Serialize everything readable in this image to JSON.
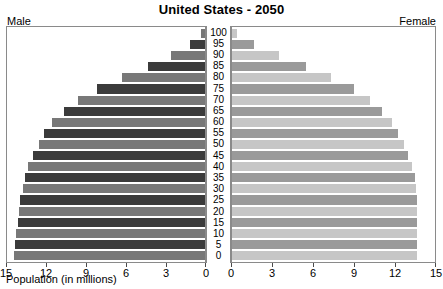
{
  "chart_data": {
    "type": "bar",
    "subtype": "population-pyramid",
    "title": "United States - 2050",
    "xlabel": "Population (in millions)",
    "ylabel": "",
    "left_heading": "Male",
    "right_heading": "Female",
    "categories": [
      "100",
      "95",
      "90",
      "85",
      "80",
      "75",
      "70",
      "65",
      "60",
      "55",
      "50",
      "45",
      "40",
      "35",
      "30",
      "25",
      "20",
      "15",
      "10",
      "5",
      "0"
    ],
    "xlim_left": [
      15,
      0
    ],
    "xlim_right": [
      0,
      15
    ],
    "xticks_left": [
      "15",
      "12",
      "9",
      "6",
      "3",
      "0"
    ],
    "xticks_right": [
      "0",
      "3",
      "6",
      "9",
      "12",
      "15"
    ],
    "tick_values": [
      0,
      3,
      6,
      9,
      12,
      15
    ],
    "grid": false,
    "legend": "none",
    "series": [
      {
        "name": "Male",
        "side": "left",
        "colors": {
          "dark": "#3b3b3b",
          "light": "#787878"
        },
        "values": [
          0.3,
          1.1,
          2.6,
          4.3,
          6.3,
          8.2,
          9.6,
          10.7,
          11.6,
          12.2,
          12.6,
          13.0,
          13.4,
          13.6,
          13.8,
          14.0,
          14.1,
          14.2,
          14.3,
          14.4,
          14.5
        ]
      },
      {
        "name": "Female",
        "side": "right",
        "colors": {
          "dark": "#9a9a9a",
          "light": "#c6c6c6"
        },
        "values": [
          0.4,
          1.6,
          3.5,
          5.5,
          7.3,
          9.0,
          10.2,
          11.1,
          11.8,
          12.3,
          12.7,
          13.0,
          13.3,
          13.5,
          13.6,
          13.7,
          13.7,
          13.7,
          13.7,
          13.7,
          13.7
        ]
      }
    ]
  }
}
